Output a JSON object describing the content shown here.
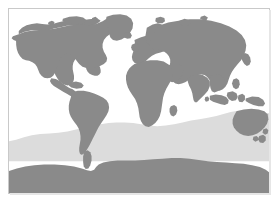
{
  "figure": {
    "kind": "world-map",
    "projection": "equirectangular",
    "width_px": 279,
    "height_px": 205,
    "caption": "",
    "title": ""
  },
  "frame": {
    "border_color": "#c9c9c9",
    "shadow_color": "#e6e6e6",
    "left_px": 8,
    "top_px": 8,
    "width_px": 262,
    "height_px": 186
  },
  "palette": {
    "background": "#ffffff",
    "ocean": "#ffffff",
    "land": "#8a8a8a",
    "highlight_band": "#dcdcdc"
  },
  "layers": [
    {
      "id": "ocean",
      "label": "Ocean",
      "color": "#ffffff"
    },
    {
      "id": "southern-band",
      "label": "Southern Ocean highlight band",
      "color": "#dcdcdc"
    },
    {
      "id": "land",
      "label": "Landmasses",
      "color": "#8a8a8a"
    }
  ],
  "regions": [
    {
      "id": "north-america",
      "label": "North America"
    },
    {
      "id": "greenland",
      "label": "Greenland"
    },
    {
      "id": "south-america",
      "label": "South America"
    },
    {
      "id": "europe",
      "label": "Europe"
    },
    {
      "id": "africa",
      "label": "Africa"
    },
    {
      "id": "asia",
      "label": "Asia"
    },
    {
      "id": "southeast-asia-islands",
      "label": "Southeast Asia Islands"
    },
    {
      "id": "australia",
      "label": "Australia"
    },
    {
      "id": "new-zealand",
      "label": "New Zealand"
    },
    {
      "id": "antarctica",
      "label": "Antarctica"
    },
    {
      "id": "iceland",
      "label": "Iceland"
    },
    {
      "id": "british-isles",
      "label": "British Isles"
    },
    {
      "id": "japan",
      "label": "Japan"
    },
    {
      "id": "madagascar",
      "label": "Madagascar"
    },
    {
      "id": "svalbard",
      "label": "Svalbard"
    },
    {
      "id": "arctic-islands",
      "label": "Arctic Islands"
    }
  ],
  "legend": {
    "visible": false,
    "entries": []
  },
  "axes": {
    "visible": false,
    "x_ticks": [],
    "y_ticks": []
  }
}
